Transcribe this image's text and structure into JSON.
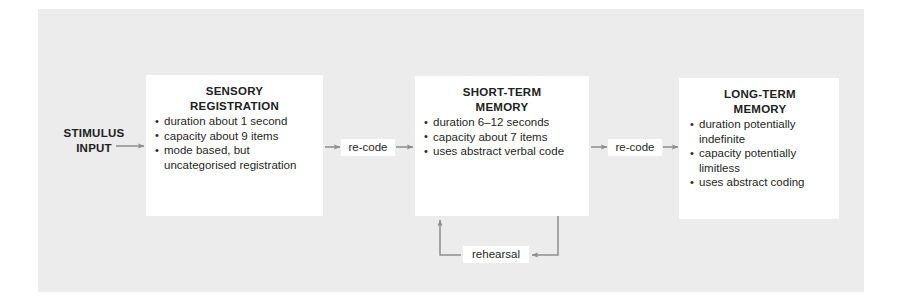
{
  "diagram": {
    "background_color": "#ececec",
    "node_color": "#ffffff",
    "text_color": "#262626",
    "wire_color": "#8d8d8d"
  },
  "input": {
    "label": "STIMULUS\nINPUT"
  },
  "nodes": [
    {
      "id": "sensory-registration",
      "title": "SENSORY\nREGISTRATION",
      "bullets": [
        "duration about 1 second",
        "capacity about 9 items",
        "mode based, but uncategorised registration"
      ]
    },
    {
      "id": "short-term-memory",
      "title": "SHORT-TERM\nMEMORY",
      "bullets": [
        "duration 6–12 seconds",
        "capacity about 7 items",
        "uses abstract verbal code"
      ]
    },
    {
      "id": "long-term-memory",
      "title": "LONG-TERM\nMEMORY",
      "bullets": [
        "duration potentially indefinite",
        "capacity potentially limitless",
        "uses abstract coding"
      ]
    }
  ],
  "connectors": [
    {
      "id": "recode-1",
      "label": "re-code"
    },
    {
      "id": "recode-2",
      "label": "re-code"
    },
    {
      "id": "rehearsal",
      "label": "rehearsal"
    }
  ]
}
